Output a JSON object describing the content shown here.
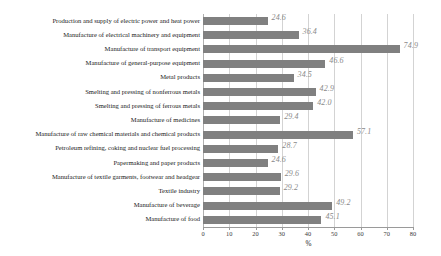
{
  "chart_data": {
    "type": "bar",
    "orientation": "horizontal",
    "title": "",
    "xlabel": "%",
    "ylabel": "",
    "xlim": [
      0,
      80
    ],
    "xticks": [
      0,
      10,
      20,
      30,
      40,
      50,
      60,
      70,
      80
    ],
    "grid": true,
    "legend": null,
    "bar_color": "#808080",
    "value_label_color": "#8a8a8a",
    "categories": [
      "Production and supply of electric power and heat power",
      "Manufacture of electrical machinery and equipment",
      "Manufacture of transport equipment",
      "Manufacture of general-purpose equipment",
      "Metal products",
      "Smelting and pressing of nonferrous metals",
      "Smelting and pressing of ferrous metals",
      "Manufacture of medicines",
      "Manufacture of raw chemical materials and chemical products",
      "Petroleum refining, coking and nuclear fuel processing",
      "Papermaking and paper products",
      "Manufacture of textile garments, footwear and headgear",
      "Textile industry",
      "Manufacture of beverage",
      "Manufacture of food"
    ],
    "values": [
      24.6,
      36.4,
      74.9,
      46.6,
      34.5,
      42.9,
      42.0,
      29.4,
      57.1,
      28.7,
      24.6,
      29.6,
      29.2,
      49.2,
      45.1
    ],
    "value_labels": [
      "24.6",
      "36.4",
      "74.9",
      "46.6",
      "34.5",
      "42.9",
      "42.0",
      "29.4",
      "57.1",
      "28.7",
      "24.6",
      "29.6",
      "29.2",
      "49.2",
      "45.1"
    ],
    "xtick_labels": [
      "0",
      "10",
      "20",
      "30",
      "40",
      "50",
      "60",
      "70",
      "80"
    ]
  }
}
